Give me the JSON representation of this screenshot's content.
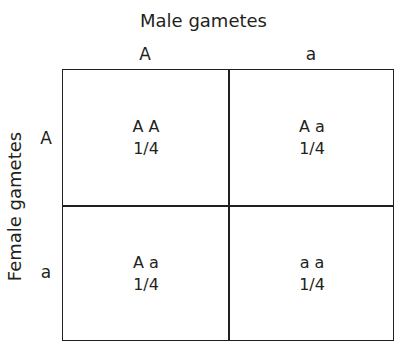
{
  "diagram": {
    "type": "punnett-square",
    "top_title": "Male gametes",
    "side_title": "Female gametes",
    "columns": [
      "A",
      "a"
    ],
    "rows": [
      "A",
      "a"
    ],
    "cells": [
      {
        "genotype": "A A",
        "probability": "1/4"
      },
      {
        "genotype": "A a",
        "probability": "1/4"
      },
      {
        "genotype": "A a",
        "probability": "1/4"
      },
      {
        "genotype": "a a",
        "probability": "1/4"
      }
    ]
  }
}
